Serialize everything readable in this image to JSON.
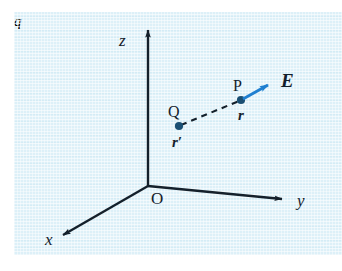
{
  "figure": {
    "kind": "physics-vector-diagram",
    "background_color": "#ddf0f8",
    "line_color": "#14202b",
    "field_vector_color": "#1f7fd0"
  },
  "axes": {
    "z": {
      "label": "z"
    },
    "y": {
      "label": "y"
    },
    "x": {
      "label": "x"
    },
    "origin": {
      "label": "O"
    }
  },
  "points": {
    "source": {
      "point_label": "Q",
      "charge_label": "q",
      "position_vector_label": "r′"
    },
    "field": {
      "point_label": "P",
      "position_vector_label": "r"
    }
  },
  "vectors": {
    "field": {
      "label": "E"
    }
  }
}
